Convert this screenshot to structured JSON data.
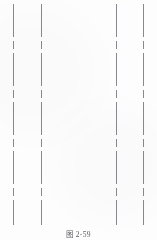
{
  "figure": {
    "caption": "图 2-59",
    "caption_y": 228,
    "background_color": "#fdfdfd",
    "width": 157,
    "height": 240
  },
  "drawing": {
    "line_color": "#7e7e86",
    "line_style": "dash-dot center line",
    "line_width_px": 1,
    "line_top": 4,
    "line_bottom": 225,
    "lines": [
      {
        "name": "center-line-1",
        "x": 13
      },
      {
        "name": "center-line-2",
        "x": 41
      },
      {
        "name": "center-line-3",
        "x": 116
      },
      {
        "name": "center-line-4",
        "x": 143
      }
    ]
  }
}
